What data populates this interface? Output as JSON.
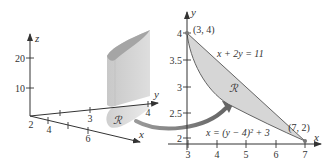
{
  "left_plot": {
    "type": "3d-solid",
    "axes": {
      "z": {
        "label": "z",
        "ticks": [
          "10",
          "20"
        ]
      },
      "y": {
        "label": "y",
        "ticks": [
          "3",
          "4"
        ]
      },
      "x": {
        "label": "x",
        "ticks": [
          "2",
          "4",
          "6"
        ]
      }
    },
    "region_label": "ℛ"
  },
  "right_plot": {
    "type": "region",
    "axes": {
      "x": {
        "label": "x",
        "ticks": [
          "3",
          "4",
          "5",
          "6",
          "7"
        ]
      },
      "y": {
        "label": "y",
        "ticks": [
          "2",
          "2.5",
          "3",
          "3.5",
          "4"
        ]
      }
    },
    "points": [
      {
        "label": "(3, 4)",
        "x": 3,
        "y": 4
      },
      {
        "label": "(7, 2)",
        "x": 7,
        "y": 2
      }
    ],
    "curves": {
      "line": "x + 2y = 11",
      "parabola": "x = (y − 4)² + 3"
    },
    "region_label": "ℛ"
  },
  "colors": {
    "axis": "#333333",
    "region_fill": "#d6d6d6",
    "solid_front": "#d4d4d4",
    "solid_top": "#a8a8a8",
    "arrow": "#6e6e6e"
  }
}
